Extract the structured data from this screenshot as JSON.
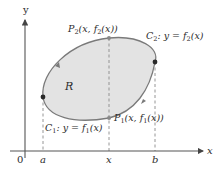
{
  "diagram": {
    "axes": {
      "x_label": "x",
      "y_label": "y",
      "origin_label": "0",
      "tick_labels": [
        "a",
        "x",
        "b"
      ]
    },
    "region": {
      "label": "R",
      "fill": "#e3e3e3",
      "stroke": "#7a7a7a"
    },
    "curves": {
      "c1": {
        "name": "C",
        "sub": "1",
        "eq_prefix": ": y = f",
        "eq_sub": "1",
        "eq_suffix": "(x)"
      },
      "c2": {
        "name": "C",
        "sub": "2",
        "eq_prefix": ": y = f",
        "eq_sub": "2",
        "eq_suffix": "(x)"
      }
    },
    "points": {
      "p1": {
        "name": "P",
        "sub": "1",
        "coord_prefix": "(x, f",
        "coord_sub": "1",
        "coord_suffix": "(x))"
      },
      "p2": {
        "name": "P",
        "sub": "2",
        "coord_prefix": "(x, f",
        "coord_sub": "2",
        "coord_suffix": "(x))"
      }
    },
    "colors": {
      "axis": "#555555",
      "dashed": "#8a8a8a",
      "point": "#2a2a2a",
      "text": "#2b2b2b"
    }
  }
}
